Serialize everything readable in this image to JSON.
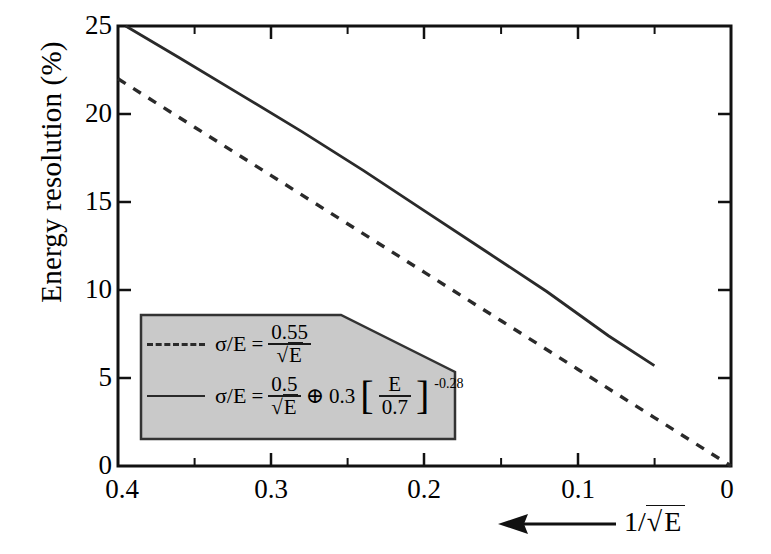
{
  "chart_data": {
    "type": "line",
    "title": "",
    "xlabel": "1/√E",
    "ylabel": "Energy resolution (%)",
    "xlim": [
      0.4,
      0.0
    ],
    "ylim": [
      0,
      25
    ],
    "x_reversed": true,
    "grid": false,
    "legend_position": "inside-lower-left",
    "xticks": [
      "0.4",
      "0.3",
      "0.2",
      "0.1",
      "0"
    ],
    "xtick_values": [
      0.4,
      0.3,
      0.2,
      0.1,
      0.0
    ],
    "xminor_step": 0.05,
    "yticks": [
      "0",
      "5",
      "10",
      "15",
      "20",
      "25"
    ],
    "ytick_values": [
      0,
      5,
      10,
      15,
      20,
      25
    ],
    "series": [
      {
        "name": "stochastic only",
        "style": "dashed",
        "color": "#2a2a2a",
        "formula": "σ/E = 0.55/√E",
        "x": [
          0.4,
          0.35,
          0.3,
          0.25,
          0.2,
          0.15,
          0.1,
          0.05,
          0.0
        ],
        "values": [
          22.0,
          19.25,
          16.5,
          13.75,
          11.0,
          8.25,
          5.5,
          2.75,
          0.0
        ]
      },
      {
        "name": "stochastic + constant term",
        "style": "solid",
        "color": "#2a2a2a",
        "formula": "σ/E = 0.5/√E ⊕ 0.3[E/0.7]^-0.28",
        "x": [
          0.395,
          0.36,
          0.32,
          0.28,
          0.24,
          0.2,
          0.16,
          0.12,
          0.08,
          0.05
        ],
        "values": [
          25.0,
          23.2,
          21.1,
          19.0,
          16.8,
          14.5,
          12.2,
          9.9,
          7.4,
          5.7
        ]
      }
    ],
    "annotations": [
      {
        "name": "x-direction-arrow",
        "text": "←",
        "label": "1/√E"
      }
    ]
  },
  "axes": {
    "ylabel": "Energy resolution (%)",
    "ytick_labels": [
      "25",
      "20",
      "15",
      "10",
      "5",
      "0"
    ],
    "xtick_labels": [
      "0.4",
      "0.3",
      "0.2",
      "0.1",
      "0"
    ],
    "x_arrow_label": "1/√E"
  },
  "legend": {
    "background": "#c9c9c9",
    "border": "#333333",
    "entries": [
      {
        "style": "dashed",
        "lhs": "σ/E",
        "equals": "=",
        "numerator": "0.55",
        "denominator": "√E",
        "extra": ""
      },
      {
        "style": "solid",
        "lhs": "σ/E",
        "equals": "=",
        "numerator": "0.5",
        "denominator": "√E",
        "oplus": "⊕",
        "coefficient": "0.3",
        "bracket_numerator": "E",
        "bracket_denominator": "0.7",
        "exponent": "-0.28"
      }
    ]
  },
  "colors": {
    "curve": "#2a2a2a",
    "axis": "#111111",
    "legend_fill": "#c9c9c9"
  }
}
